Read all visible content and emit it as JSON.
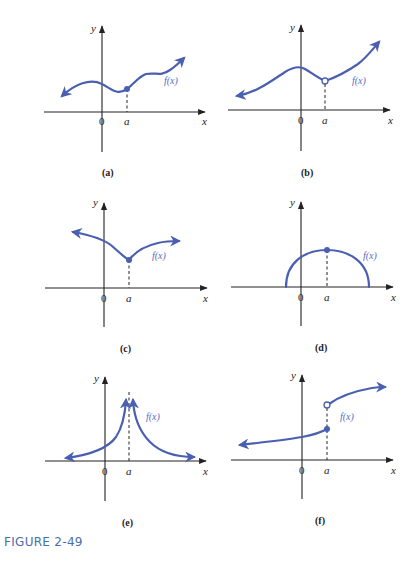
{
  "figure": {
    "title": "FIGURE 2-49",
    "colors": {
      "curve": "#4a5fb0",
      "axis": "#222222",
      "title": "#4a6fa8"
    }
  },
  "panels": [
    {
      "id": "a",
      "caption": "(a)",
      "y_label": "y",
      "x_label": "x",
      "origin_label": "0",
      "a_label": "a",
      "func_label": "f(x)",
      "description": "Continuous wavy curve with filled point at x=a"
    },
    {
      "id": "b",
      "caption": "(b)",
      "y_label": "y",
      "x_label": "x",
      "origin_label": "0",
      "a_label": "a",
      "func_label": "f(x)",
      "description": "Curve with hole (open circle) at x=a"
    },
    {
      "id": "c",
      "caption": "(c)",
      "y_label": "y",
      "x_label": "x",
      "origin_label": "0",
      "a_label": "a",
      "func_label": "f(x)",
      "description": "Cusp with filled point at x=a"
    },
    {
      "id": "d",
      "caption": "(d)",
      "y_label": "y",
      "x_label": "x",
      "origin_label": "0",
      "a_label": "a",
      "func_label": "f(x)",
      "description": "Semicircle with maximum filled point at x=a"
    },
    {
      "id": "e",
      "caption": "(e)",
      "y_label": "y",
      "x_label": "x",
      "origin_label": "0",
      "a_label": "a",
      "func_label": "f(x)",
      "description": "Vertical asymptote at x=a, both sides go to +infinity"
    },
    {
      "id": "f",
      "caption": "(f)",
      "y_label": "y",
      "x_label": "x",
      "origin_label": "0",
      "a_label": "a",
      "func_label": "f(x)",
      "description": "Jump discontinuity at x=a: filled point below, open circle above"
    }
  ]
}
